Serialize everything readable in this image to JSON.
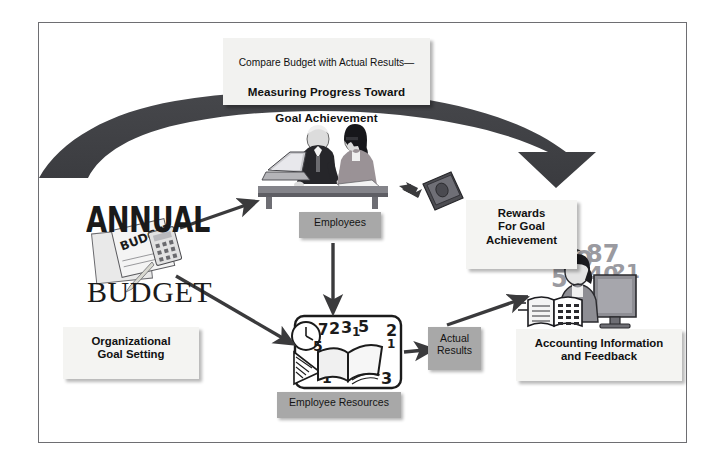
{
  "diagram": {
    "title": {
      "line1": "Compare Budget with Actual Results—",
      "line2": "Measuring Progress Toward",
      "line3": "Goal Achievement"
    },
    "nodes": {
      "annual_word": "ANNUAL",
      "budget_word": "BUDGET",
      "goal_setting": "Organizational\nGoal Setting",
      "employees": "Employees",
      "employee_resources": "Employee Resources",
      "actual_results": "Actual\nResults",
      "rewards": "Rewards\nFor Goal\nAchievement",
      "accounting": "Accounting Information\nand Feedback"
    },
    "icons": {
      "budget_clipboard": "budget-clipboard-icon",
      "employees_photo": "two-employees-at-desk-icon",
      "book": "open-book-with-clock-icon",
      "money": "cash-money-icon",
      "accountant": "accountant-at-computer-icon"
    },
    "colors": {
      "arch": "#3f4044",
      "gray_box": "#a8a8a8",
      "white_box": "#f2f2f0",
      "arrow": "#3a3a3c",
      "frame": "#6e6e72",
      "text": "#111111"
    }
  }
}
